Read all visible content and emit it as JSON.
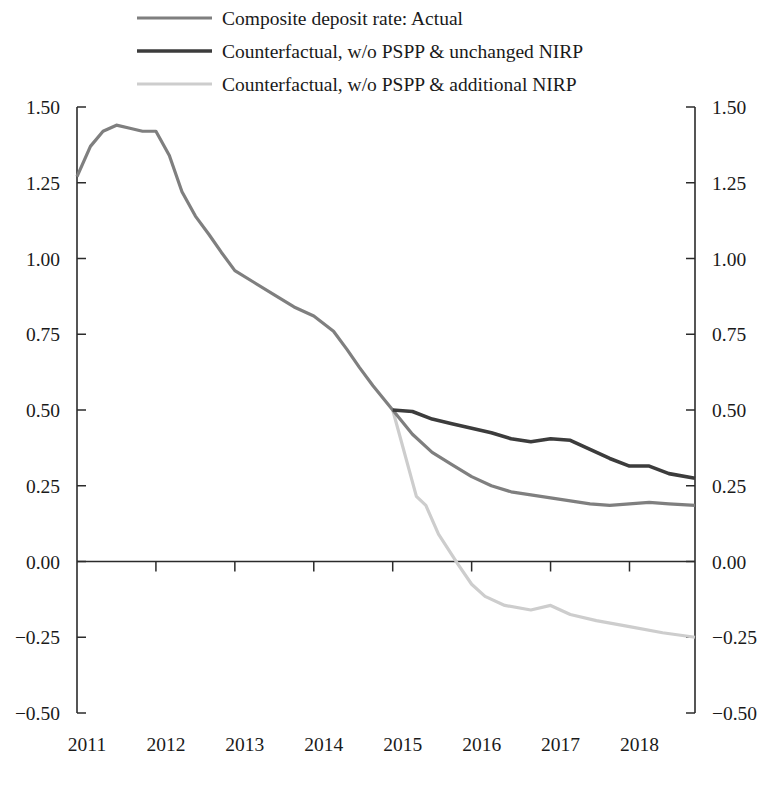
{
  "chart_data": {
    "type": "line",
    "title": "",
    "xlabel": "",
    "ylabel": "",
    "xlim": [
      2011.0,
      2018.83
    ],
    "ylim": [
      -0.5,
      1.5
    ],
    "grid": false,
    "legend_position": "top-left",
    "y_ticks": [
      "1.50",
      "1.25",
      "1.00",
      "0.75",
      "0.50",
      "0.25",
      "0.00",
      "-0.25",
      "-0.50"
    ],
    "y_tick_values": [
      1.5,
      1.25,
      1.0,
      0.75,
      0.5,
      0.25,
      0.0,
      -0.25,
      -0.5
    ],
    "x_ticks": [
      "2011",
      "2012",
      "2013",
      "2014",
      "2015",
      "2016",
      "2017",
      "2018"
    ],
    "x_tick_values": [
      2011,
      2012,
      2013,
      2014,
      2015,
      2016,
      2017,
      2018
    ],
    "dual_y_axis": true,
    "colors": {
      "actual": "#7f7f7f",
      "unchanged_nirp": "#3c3c3c",
      "additional_nirp": "#cdcdcd",
      "axis": "#2b2b2b",
      "text": "#1a1a1a",
      "background": "#ffffff"
    },
    "series": [
      {
        "name": "Composite deposit rate: Actual",
        "color": "#7f7f7f",
        "width": 3.2,
        "x": [
          2011.0,
          2011.17,
          2011.33,
          2011.5,
          2011.67,
          2011.83,
          2012.0,
          2012.17,
          2012.33,
          2012.5,
          2012.67,
          2012.83,
          2013.0,
          2013.25,
          2013.5,
          2013.75,
          2014.0,
          2014.25,
          2014.42,
          2014.58,
          2014.75,
          2015.0,
          2015.25,
          2015.5,
          2015.75,
          2016.0,
          2016.25,
          2016.5,
          2016.75,
          2017.0,
          2017.25,
          2017.5,
          2017.75,
          2018.0,
          2018.25,
          2018.5,
          2018.83
        ],
        "y": [
          1.27,
          1.37,
          1.42,
          1.44,
          1.43,
          1.42,
          1.42,
          1.34,
          1.22,
          1.14,
          1.08,
          1.02,
          0.96,
          0.92,
          0.88,
          0.84,
          0.81,
          0.76,
          0.7,
          0.64,
          0.58,
          0.5,
          0.42,
          0.36,
          0.32,
          0.28,
          0.25,
          0.23,
          0.22,
          0.21,
          0.2,
          0.19,
          0.185,
          0.19,
          0.195,
          0.19,
          0.185
        ]
      },
      {
        "name": "Counterfactual, w/o PSPP & unchanged NIRP",
        "color": "#3c3c3c",
        "width": 3.6,
        "x": [
          2015.0,
          2015.25,
          2015.5,
          2015.75,
          2016.0,
          2016.25,
          2016.5,
          2016.75,
          2017.0,
          2017.25,
          2017.5,
          2017.75,
          2018.0,
          2018.25,
          2018.5,
          2018.83
        ],
        "y": [
          0.5,
          0.495,
          0.47,
          0.455,
          0.44,
          0.425,
          0.405,
          0.395,
          0.405,
          0.4,
          0.37,
          0.34,
          0.315,
          0.315,
          0.29,
          0.275
        ]
      },
      {
        "name": "Counterfactual, w/o PSPP & additional NIRP",
        "color": "#cdcdcd",
        "width": 3.2,
        "x": [
          2015.0,
          2015.3,
          2015.42,
          2015.58,
          2015.83,
          2016.0,
          2016.17,
          2016.42,
          2016.75,
          2017.0,
          2017.25,
          2017.58,
          2018.0,
          2018.42,
          2018.83
        ],
        "y": [
          0.5,
          0.215,
          0.185,
          0.09,
          -0.01,
          -0.075,
          -0.115,
          -0.145,
          -0.16,
          -0.145,
          -0.175,
          -0.195,
          -0.215,
          -0.235,
          -0.25
        ]
      }
    ]
  },
  "legend": {
    "items": [
      {
        "label": "Composite deposit rate: Actual",
        "color": "#7f7f7f",
        "width": 3.2
      },
      {
        "label": "Counterfactual, w/o PSPP & unchanged NIRP",
        "color": "#3c3c3c",
        "width": 3.6
      },
      {
        "label": "Counterfactual, w/o PSPP & additional NIRP",
        "color": "#cdcdcd",
        "width": 3.2
      }
    ]
  },
  "axes": {
    "left_labels": [
      "1.50",
      "1.25",
      "1.00",
      "0.75",
      "0.50",
      "0.25",
      "0.00",
      "-0.25",
      "-0.50"
    ],
    "right_labels": [
      "1.50",
      "1.25",
      "1.00",
      "0.75",
      "0.50",
      "0.25",
      "0.00",
      "-0.25",
      "-0.50"
    ],
    "bottom_labels": [
      "2011",
      "2012",
      "2013",
      "2014",
      "2015",
      "2016",
      "2017",
      "2018"
    ]
  }
}
